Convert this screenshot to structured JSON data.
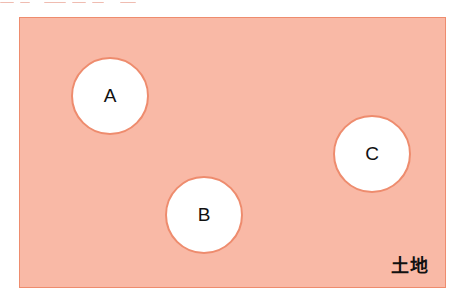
{
  "diagram": {
    "land": {
      "label": "土地",
      "fill_color": "#f9b9a6",
      "border_color": "#ee8c6e"
    },
    "circles": [
      {
        "label": "A",
        "fill_color": "#ffffff",
        "border_color": "#ee8c6e"
      },
      {
        "label": "B",
        "fill_color": "#ffffff",
        "border_color": "#ee8c6e"
      },
      {
        "label": "C",
        "fill_color": "#ffffff",
        "border_color": "#ee8c6e"
      }
    ]
  }
}
